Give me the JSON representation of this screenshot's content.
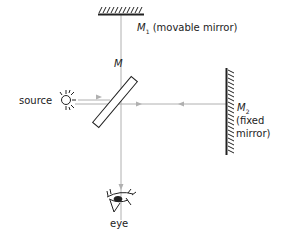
{
  "diagram": {
    "labels": {
      "m1": "M",
      "m1_sub": "1",
      "m1_desc": "(movable mirror)",
      "m": "M",
      "m2": "M",
      "m2_sub": "2",
      "m2_desc_1": "(fixed",
      "m2_desc_2": "mirror)",
      "source": "source",
      "eye": "eye"
    },
    "colors": {
      "beam": "#b0b0b0",
      "ink": "#222222"
    },
    "components": [
      {
        "id": "m1",
        "type": "mirror",
        "label": "M1 (movable mirror)"
      },
      {
        "id": "m",
        "type": "beam-splitter",
        "label": "M"
      },
      {
        "id": "m2",
        "type": "mirror",
        "label": "M2 (fixed mirror)"
      },
      {
        "id": "source",
        "type": "light-source",
        "label": "source"
      },
      {
        "id": "eye",
        "type": "observer",
        "label": "eye"
      }
    ]
  }
}
